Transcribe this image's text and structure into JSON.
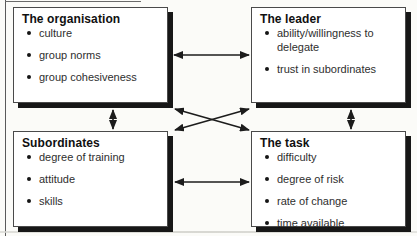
{
  "figure": {
    "boxes": [
      {
        "id": "organisation",
        "title": "The organisation",
        "items": [
          "culture",
          "group norms",
          "group cohesiveness"
        ]
      },
      {
        "id": "leader",
        "title": "The leader",
        "items": [
          "ability/willingness to delegate",
          "trust in subordinates"
        ]
      },
      {
        "id": "subordinates",
        "title": "Subordinates",
        "items": [
          "degree of training",
          "attitude",
          "skills"
        ]
      },
      {
        "id": "task",
        "title": "The task",
        "items": [
          "difficulty",
          "degree of risk",
          "rate of change",
          "time available"
        ]
      }
    ],
    "connections": [
      {
        "from": "organisation",
        "to": "leader",
        "style": "double-headed-arrow"
      },
      {
        "from": "subordinates",
        "to": "task",
        "style": "double-headed-arrow"
      },
      {
        "from": "organisation",
        "to": "subordinates",
        "style": "double-headed-arrow"
      },
      {
        "from": "leader",
        "to": "task",
        "style": "double-headed-arrow"
      },
      {
        "from": "organisation",
        "to": "task",
        "style": "double-headed-arrow"
      },
      {
        "from": "leader",
        "to": "subordinates",
        "style": "double-headed-arrow"
      }
    ],
    "colors": {
      "box_background": "#ffffff",
      "box_border": "#4a4a4a",
      "box_shadow": "#171717",
      "title_text": "#101010",
      "item_text": "#2e2e2e",
      "arrow": "#1c1c1c",
      "frame_line": "#5a5a5a"
    }
  }
}
